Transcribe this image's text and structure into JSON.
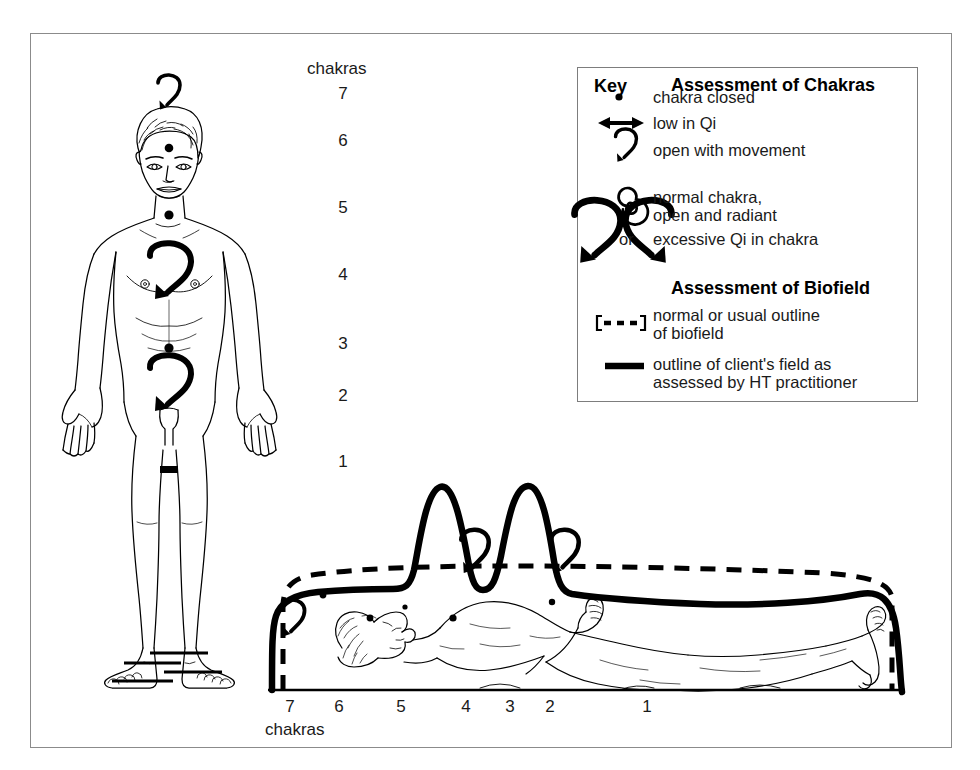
{
  "figure": {
    "standing_label": "chakras",
    "reclining_label": "chakras",
    "standing_chakra_numbers": [
      "7",
      "6",
      "5",
      "4",
      "3",
      "2",
      "1"
    ],
    "axis_chakra_numbers": [
      "7",
      "6",
      "5",
      "4",
      "3",
      "2",
      "1"
    ]
  },
  "key": {
    "key_label": "Key",
    "chakras_heading": "Assessment of Chakras",
    "biofield_heading": "Assessment of Biofield",
    "or_label": "or",
    "chakra_items": [
      {
        "symbol": "dot",
        "label": "chakra closed"
      },
      {
        "symbol": "double-arrow",
        "label": "low in Qi"
      },
      {
        "symbol": "hook-arrow",
        "label": "open with movement"
      },
      {
        "symbol": "spiral",
        "label_line1": "normal chakra,",
        "label_line2": "open and radiant"
      },
      {
        "symbol": "large-hook-pair",
        "label": "excessive Qi in chakra"
      }
    ],
    "biofield_items": [
      {
        "symbol": "bracketed-dashed",
        "label_line1": "normal or usual outline",
        "label_line2": "of biofield"
      },
      {
        "symbol": "thick-solid",
        "label_line1": "outline of client's field as",
        "label_line2": "assessed by HT practitioner"
      }
    ]
  },
  "standing_figure": {
    "markers": [
      {
        "chakra": "7",
        "symbol": "hook-arrow"
      },
      {
        "chakra": "6",
        "symbol": "dot"
      },
      {
        "chakra": "5",
        "symbol": "dot"
      },
      {
        "chakra": "4",
        "symbol": "large-hook-arrow"
      },
      {
        "chakra": "3",
        "symbol": "dot"
      },
      {
        "chakra": "2",
        "symbol": "large-hook-arrow"
      },
      {
        "chakra": "1",
        "symbol": "low-in-qi-bar"
      }
    ]
  },
  "reclining_figure": {
    "markers": [
      {
        "chakra": "7",
        "symbol": "hook-arrow"
      },
      {
        "chakra": "6",
        "symbol": "dot"
      },
      {
        "chakra": "5",
        "symbol": "dot"
      },
      {
        "chakra": "4",
        "symbol": "hook-arrow"
      },
      {
        "chakra": "3",
        "symbol": "dot"
      },
      {
        "chakra": "2",
        "symbol": "hook-arrow"
      },
      {
        "chakra": "1",
        "symbol": "dot"
      }
    ],
    "biofield": {
      "normal_outline": "dashed",
      "client_outline": "solid",
      "peaks_at_chakras": [
        "4",
        "2"
      ]
    }
  },
  "colors": {
    "ink": "#000000",
    "frame": "#8b8b8b",
    "text": "#1a1a1a",
    "background": "#ffffff"
  }
}
